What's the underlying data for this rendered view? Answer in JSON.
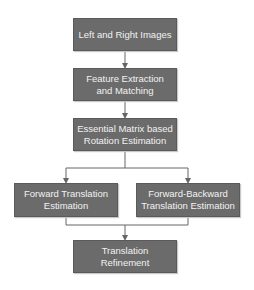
{
  "diagram": {
    "type": "flowchart",
    "colors": {
      "box_fill": "#6b6b6b",
      "box_text": "#f2f2f2",
      "connector": "#666666",
      "background": "#ffffff"
    },
    "nodes": [
      {
        "id": "n1",
        "label": "Left and Right Images"
      },
      {
        "id": "n2",
        "label_line1": "Feature Extraction",
        "label_line2": "and Matching"
      },
      {
        "id": "n3",
        "label_line1": "Essential Matrix based",
        "label_line2": "Rotation Estimation"
      },
      {
        "id": "n4",
        "label_line1": "Forward Translation",
        "label_line2": "Estimation"
      },
      {
        "id": "n5",
        "label_line1": "Forward-Backward",
        "label_line2": "Translation Estimation"
      },
      {
        "id": "n6",
        "label_line1": "Translation",
        "label_line2": "Refinement"
      }
    ],
    "edges": [
      {
        "from": "n1",
        "to": "n2"
      },
      {
        "from": "n2",
        "to": "n3"
      },
      {
        "from": "n3",
        "to": "n4"
      },
      {
        "from": "n3",
        "to": "n5"
      },
      {
        "from": "n4",
        "to": "n6"
      },
      {
        "from": "n5",
        "to": "n6"
      }
    ]
  }
}
